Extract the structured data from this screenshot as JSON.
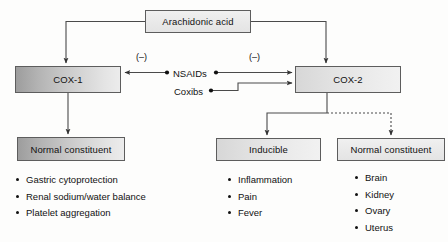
{
  "diagram": {
    "nodes": {
      "arachidonic": "Arachidonic acid",
      "cox1": "COX-1",
      "cox2": "COX-2",
      "normal_left": "Normal constituent",
      "inducible": "Inducible",
      "normal_right": "Normal constituent"
    },
    "drugs": {
      "nsaids": "NSAIDs",
      "coxibs": "Coxibs"
    },
    "inhibition": {
      "cox1_symbol": "(–)",
      "cox2_symbol": "(–)"
    },
    "lists": {
      "cox1_functions": [
        "Gastric cytoprotection",
        "Renal sodium/water balance",
        "Platelet aggregation"
      ],
      "cox2_inducible": [
        "Inflammation",
        "Pain",
        "Fever"
      ],
      "cox2_constitutive": [
        "Brain",
        "Kidney",
        "Ovary",
        "Uterus"
      ]
    },
    "colors": {
      "line": "#4a4a4a",
      "text": "#111111",
      "box_border": "#5d5d5d",
      "background": "#fdfdfc"
    }
  }
}
